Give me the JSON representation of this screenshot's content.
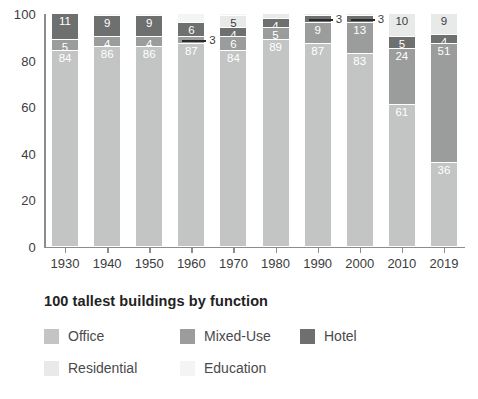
{
  "caption": "100 tallest buildings by function",
  "colors": {
    "office": "#c3c4c4",
    "mixed_use": "#9b9c9c",
    "hotel": "#6e6f6f",
    "residential": "#e8e9e9",
    "education": "#f3f4f4",
    "axis": "#8c8c8c",
    "text": "#3c3c3c",
    "caption": "#222222"
  },
  "legend": {
    "rows": [
      [
        {
          "label": "Office",
          "key": "office"
        },
        {
          "label": "Mixed-Use",
          "key": "mixed_use"
        },
        {
          "label": "Hotel",
          "key": "hotel"
        }
      ],
      [
        {
          "label": "Residential",
          "key": "residential"
        },
        {
          "label": "Education",
          "key": "education"
        }
      ]
    ]
  },
  "chart_data": {
    "type": "bar",
    "subtype": "stacked-percentage",
    "title": "100 tallest buildings by function",
    "xlabel": "",
    "ylabel": "",
    "ylim": [
      0,
      100
    ],
    "yticks": [
      0,
      20,
      40,
      60,
      80,
      100
    ],
    "grid": false,
    "legend_position": "below",
    "categories": [
      "1930",
      "1940",
      "1950",
      "1960",
      "1970",
      "1980",
      "1990",
      "2000",
      "2010",
      "2019"
    ],
    "series": [
      {
        "name": "Office",
        "key": "office",
        "values": [
          84,
          86,
          86,
          87,
          84,
          89,
          87,
          83,
          61,
          36
        ]
      },
      {
        "name": "Mixed-Use",
        "key": "mixed_use",
        "values": [
          5,
          4,
          4,
          3,
          6,
          5,
          9,
          13,
          24,
          51
        ]
      },
      {
        "name": "Hotel",
        "key": "hotel",
        "values": [
          11,
          9,
          9,
          6,
          4,
          4,
          3,
          3,
          5,
          4
        ]
      },
      {
        "name": "Residential",
        "key": "residential",
        "values": [
          0,
          0,
          0,
          0,
          5,
          2,
          1,
          1,
          10,
          9
        ]
      },
      {
        "name": "Education",
        "key": "education",
        "values": [
          0,
          1,
          1,
          4,
          1,
          0,
          0,
          0,
          0,
          0
        ]
      }
    ],
    "bars": [
      {
        "category": "1930",
        "segments": [
          {
            "key": "office",
            "value": 84,
            "label": "84",
            "label_color": "light"
          },
          {
            "key": "mixed_use",
            "value": 5,
            "label": "5",
            "label_color": "light"
          },
          {
            "key": "hotel",
            "value": 11,
            "label": "11",
            "label_color": "light"
          }
        ]
      },
      {
        "category": "1940",
        "segments": [
          {
            "key": "office",
            "value": 86,
            "label": "86",
            "label_color": "light"
          },
          {
            "key": "mixed_use",
            "value": 4,
            "label": "4",
            "label_color": "light"
          },
          {
            "key": "hotel",
            "value": 9,
            "label": "9",
            "label_color": "light"
          },
          {
            "key": "education",
            "value": 1,
            "label": "",
            "label_color": "dark"
          }
        ]
      },
      {
        "category": "1950",
        "segments": [
          {
            "key": "office",
            "value": 86,
            "label": "86",
            "label_color": "light"
          },
          {
            "key": "mixed_use",
            "value": 4,
            "label": "4",
            "label_color": "light"
          },
          {
            "key": "hotel",
            "value": 9,
            "label": "9",
            "label_color": "light"
          },
          {
            "key": "education",
            "value": 1,
            "label": "",
            "label_color": "dark"
          }
        ]
      },
      {
        "category": "1960",
        "segments": [
          {
            "key": "office",
            "value": 87,
            "label": "87",
            "label_color": "light"
          },
          {
            "key": "mixed_use",
            "value": 3,
            "label": "",
            "label_color": "light",
            "callout": "3"
          },
          {
            "key": "hotel",
            "value": 6,
            "label": "6",
            "label_color": "light"
          },
          {
            "key": "education",
            "value": 4,
            "label": "",
            "label_color": "dark"
          }
        ]
      },
      {
        "category": "1970",
        "segments": [
          {
            "key": "office",
            "value": 84,
            "label": "84",
            "label_color": "light"
          },
          {
            "key": "mixed_use",
            "value": 6,
            "label": "6",
            "label_color": "light"
          },
          {
            "key": "hotel",
            "value": 4,
            "label": "4",
            "label_color": "light"
          },
          {
            "key": "residential",
            "value": 5,
            "label": "5",
            "label_color": "dark"
          },
          {
            "key": "education",
            "value": 1,
            "label": "",
            "label_color": "dark"
          }
        ]
      },
      {
        "category": "1980",
        "segments": [
          {
            "key": "office",
            "value": 89,
            "label": "89",
            "label_color": "light"
          },
          {
            "key": "mixed_use",
            "value": 5,
            "label": "5",
            "label_color": "light"
          },
          {
            "key": "hotel",
            "value": 4,
            "label": "4",
            "label_color": "light"
          },
          {
            "key": "residential",
            "value": 2,
            "label": "",
            "label_color": "dark"
          }
        ]
      },
      {
        "category": "1990",
        "segments": [
          {
            "key": "office",
            "value": 87,
            "label": "87",
            "label_color": "light"
          },
          {
            "key": "mixed_use",
            "value": 9,
            "label": "9",
            "label_color": "light"
          },
          {
            "key": "hotel",
            "value": 3,
            "label": "",
            "label_color": "light",
            "callout": "3"
          },
          {
            "key": "residential",
            "value": 1,
            "label": "",
            "label_color": "dark"
          }
        ]
      },
      {
        "category": "2000",
        "segments": [
          {
            "key": "office",
            "value": 83,
            "label": "83",
            "label_color": "light"
          },
          {
            "key": "mixed_use",
            "value": 13,
            "label": "13",
            "label_color": "light"
          },
          {
            "key": "hotel",
            "value": 3,
            "label": "",
            "label_color": "light",
            "callout": "3"
          },
          {
            "key": "residential",
            "value": 1,
            "label": "",
            "label_color": "dark"
          }
        ]
      },
      {
        "category": "2010",
        "segments": [
          {
            "key": "office",
            "value": 61,
            "label": "61",
            "label_color": "light"
          },
          {
            "key": "mixed_use",
            "value": 24,
            "label": "24",
            "label_color": "light"
          },
          {
            "key": "hotel",
            "value": 5,
            "label": "5",
            "label_color": "light"
          },
          {
            "key": "residential",
            "value": 10,
            "label": "10",
            "label_color": "dark"
          }
        ]
      },
      {
        "category": "2019",
        "segments": [
          {
            "key": "office",
            "value": 36,
            "label": "36",
            "label_color": "light"
          },
          {
            "key": "mixed_use",
            "value": 51,
            "label": "51",
            "label_color": "light"
          },
          {
            "key": "hotel",
            "value": 4,
            "label": "4",
            "label_color": "light"
          },
          {
            "key": "residential",
            "value": 9,
            "label": "9",
            "label_color": "dark"
          }
        ]
      }
    ]
  }
}
